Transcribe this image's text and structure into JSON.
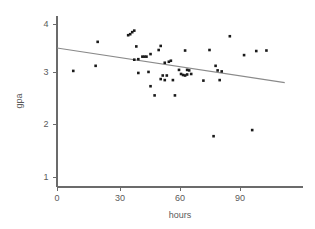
{
  "chart_data": {
    "type": "scatter",
    "title": "",
    "xlabel": "hours",
    "ylabel": "gpa",
    "xlim": [
      0,
      113
    ],
    "ylim": [
      1,
      4.15
    ],
    "xticks": [
      0,
      30,
      60,
      90
    ],
    "yticks": [
      1,
      2,
      3,
      4
    ],
    "xtick_labels": [
      "0",
      "30",
      "60",
      "90"
    ],
    "ytick_labels": [
      "1",
      "2",
      "3",
      "4"
    ],
    "grid": false,
    "legend": false,
    "marker": "square",
    "marker_color": "#1a1a1a",
    "line_color": "#8a8a8a",
    "axis_color": "#6b6b6b",
    "series": [
      {
        "name": "students",
        "x": [
          8,
          19,
          20,
          35,
          36,
          37,
          38,
          38,
          39,
          40,
          40,
          42,
          43,
          44,
          45,
          46,
          46,
          48,
          50,
          51,
          51,
          52,
          53,
          53,
          54,
          55,
          56,
          57,
          58,
          60,
          61,
          62,
          63,
          63,
          64,
          64,
          65,
          66,
          72,
          75,
          77,
          78,
          79,
          80,
          81,
          85,
          92,
          96,
          98,
          103
        ],
        "y": [
          3.08,
          3.18,
          3.65,
          3.78,
          3.8,
          3.84,
          3.87,
          3.3,
          3.56,
          3.31,
          3.04,
          3.36,
          3.36,
          3.36,
          3.06,
          3.41,
          2.78,
          2.6,
          3.49,
          3.57,
          2.92,
          2.99,
          3.24,
          2.9,
          2.99,
          3.26,
          3.28,
          2.9,
          2.6,
          3.1,
          3.02,
          3.0,
          3.48,
          2.99,
          3.1,
          3.01,
          3.09,
          3.02,
          2.89,
          3.49,
          1.8,
          3.18,
          3.09,
          2.9,
          3.07,
          3.76,
          3.39,
          1.92,
          3.47,
          3.48
        ]
      }
    ],
    "fit_line": {
      "name": "least-squares fit",
      "x_start": 0,
      "y_start": 3.53,
      "x_end": 112,
      "y_end": 2.85
    }
  },
  "axes": {
    "x_title": "hours",
    "y_title": "gpa"
  }
}
